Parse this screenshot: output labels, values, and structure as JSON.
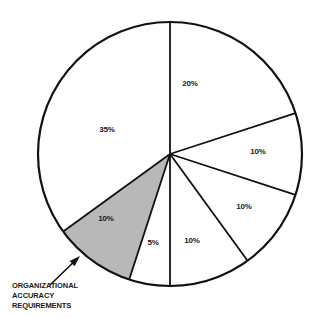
{
  "chart_data": {
    "type": "pie",
    "title": "",
    "subtitle": "",
    "xlabel": "",
    "ylabel": "",
    "legend_position": "none",
    "grid": false,
    "start_angle_deg": 0,
    "direction": "clockwise",
    "center": {
      "x": 170,
      "y": 154
    },
    "radius": 132,
    "total": 100,
    "categories": [
      "slice-1",
      "slice-2",
      "slice-3",
      "slice-4",
      "slice-5",
      "organizational-accuracy-requirements",
      "slice-7"
    ],
    "values": [
      20,
      10,
      10,
      10,
      5,
      10,
      35
    ],
    "labels": [
      "20%",
      "10%",
      "10%",
      "10%",
      "5%",
      "10%",
      "35%"
    ],
    "slices": [
      {
        "label": "20%",
        "value": 20,
        "start_deg": 0,
        "end_deg": 72,
        "fill": "#ffffff",
        "highlighted": false,
        "label_x": 190,
        "label_y": 84
      },
      {
        "label": "10%",
        "value": 10,
        "start_deg": 72,
        "end_deg": 108,
        "fill": "#ffffff",
        "highlighted": false,
        "label_x": 258,
        "label_y": 152
      },
      {
        "label": "10%",
        "value": 10,
        "start_deg": 108,
        "end_deg": 144,
        "fill": "#ffffff",
        "highlighted": false,
        "label_x": 244,
        "label_y": 207
      },
      {
        "label": "10%",
        "value": 10,
        "start_deg": 144,
        "end_deg": 180,
        "fill": "#ffffff",
        "highlighted": false,
        "label_x": 192,
        "label_y": 241
      },
      {
        "label": "5%",
        "value": 5,
        "start_deg": 180,
        "end_deg": 198,
        "fill": "#ffffff",
        "highlighted": false,
        "label_x": 153,
        "label_y": 243
      },
      {
        "label": "10%",
        "value": 10,
        "start_deg": 198,
        "end_deg": 234,
        "fill": "#b8b8b8",
        "highlighted": true,
        "label_x": 106,
        "label_y": 219
      },
      {
        "label": "35%",
        "value": 35,
        "start_deg": 234,
        "end_deg": 360,
        "fill": "#ffffff",
        "highlighted": false,
        "label_x": 107,
        "label_y": 130
      }
    ],
    "annotations": [
      {
        "name": "organizational-accuracy-requirements-callout",
        "lines": [
          "ORGANIZATIONAL",
          "ACCURACY",
          "REQUIREMENTS"
        ],
        "text_x": 12,
        "text_y": 288,
        "line_height": 10,
        "arrow_tail": {
          "x": 50,
          "y": 285
        },
        "arrow_head": {
          "x": 80,
          "y": 256
        }
      }
    ]
  },
  "style": {
    "stroke_color": "#111111",
    "outline_width": 2.2,
    "divider_width": 1.8,
    "background": "#ffffff",
    "highlight_fill": "#b8b8b8",
    "plain_fill": "#ffffff",
    "text_color": "#1a1a1a"
  }
}
